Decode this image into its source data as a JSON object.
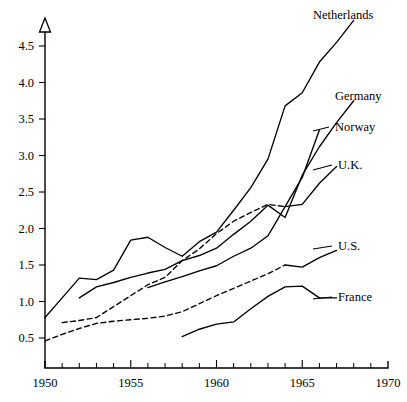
{
  "chart_data": {
    "type": "line",
    "title": "",
    "subtitle": "",
    "xlabel": "",
    "ylabel": "",
    "xlim": [
      1950,
      1970
    ],
    "ylim": [
      0,
      4.9
    ],
    "grid": false,
    "legend_position": "right-end-labels",
    "x_ticks_major": [
      1950,
      1955,
      1960,
      1965,
      1970
    ],
    "x_tick_labels": [
      "1950",
      "1955",
      "1960",
      "1965",
      "1970"
    ],
    "x_ticks_minor": [
      1951,
      1952,
      1953,
      1954,
      1956,
      1957,
      1958,
      1959,
      1961,
      1962,
      1963,
      1964,
      1966,
      1967,
      1968,
      1969
    ],
    "y_ticks": [
      0.5,
      1.0,
      1.5,
      2.0,
      2.5,
      3.0,
      3.5,
      4.0,
      4.5
    ],
    "y_tick_labels": [
      "0.5",
      "1.0",
      "1.5",
      "2.0",
      "2.5",
      "3.0",
      "3.5",
      "4.0",
      "4.5"
    ],
    "y_axis_arrow": true,
    "series": [
      {
        "name": "Netherlands",
        "style": "solid",
        "label": "Netherlands",
        "x": [
          1950,
          1951,
          1952,
          1953,
          1954,
          1955,
          1956,
          1957,
          1958,
          1959,
          1960,
          1961,
          1962,
          1963,
          1964,
          1965,
          1966,
          1967,
          1968
        ],
        "values": [
          0.78,
          1.05,
          1.32,
          1.3,
          1.43,
          1.84,
          1.88,
          1.74,
          1.62,
          1.82,
          1.95,
          2.25,
          2.56,
          2.95,
          3.68,
          3.86,
          4.28,
          4.55,
          4.85
        ]
      },
      {
        "name": "Germany",
        "style": "solid",
        "label": "Germany",
        "x": [
          1952,
          1953,
          1954,
          1955,
          1956,
          1957,
          1958,
          1959,
          1960,
          1961,
          1962,
          1963,
          1964,
          1965,
          1966,
          1967,
          1968
        ],
        "values": [
          1.05,
          1.2,
          1.26,
          1.33,
          1.39,
          1.44,
          1.56,
          1.63,
          1.73,
          1.92,
          2.1,
          2.32,
          2.15,
          2.73,
          3.12,
          3.45,
          3.75
        ]
      },
      {
        "name": "Norway",
        "style": "dashed-then-solid",
        "label": "Norway",
        "solid_from": 1964,
        "x": [
          1951,
          1952,
          1953,
          1954,
          1955,
          1956,
          1957,
          1958,
          1959,
          1960,
          1961,
          1962,
          1963,
          1964,
          1965,
          1966
        ],
        "values": [
          0.71,
          0.74,
          0.78,
          0.93,
          1.08,
          1.23,
          1.33,
          1.56,
          1.72,
          1.93,
          2.1,
          2.22,
          2.33,
          2.3,
          2.7,
          3.35
        ]
      },
      {
        "name": "U.K.",
        "style": "solid",
        "label": "U.K.",
        "x": [
          1956,
          1957,
          1958,
          1959,
          1960,
          1961,
          1962,
          1963,
          1964,
          1965,
          1966,
          1967
        ],
        "values": [
          1.19,
          1.27,
          1.34,
          1.42,
          1.49,
          1.62,
          1.73,
          1.9,
          2.3,
          2.33,
          2.62,
          2.85
        ]
      },
      {
        "name": "U.S.",
        "style": "dashed-then-solid",
        "label": "U.S.",
        "solid_from": 1964,
        "x": [
          1950,
          1951,
          1952,
          1953,
          1954,
          1955,
          1956,
          1957,
          1958,
          1959,
          1960,
          1961,
          1962,
          1963,
          1964,
          1965,
          1966,
          1967
        ],
        "values": [
          0.46,
          0.55,
          0.63,
          0.7,
          0.73,
          0.75,
          0.77,
          0.8,
          0.86,
          0.97,
          1.08,
          1.18,
          1.28,
          1.38,
          1.5,
          1.47,
          1.6,
          1.7
        ]
      },
      {
        "name": "France",
        "style": "solid",
        "label": "France",
        "x": [
          1958,
          1959,
          1960,
          1961,
          1962,
          1963,
          1964,
          1965,
          1966,
          1967
        ],
        "values": [
          0.52,
          0.62,
          0.69,
          0.72,
          0.9,
          1.07,
          1.2,
          1.21,
          1.05,
          1.05
        ]
      }
    ],
    "annotations": []
  },
  "labels": {
    "netherlands": "Netherlands",
    "germany": "Germany",
    "norway": "Norway",
    "uk": "U.K.",
    "us": "U.S.",
    "france": "France"
  },
  "colors": {
    "ink": "#000000",
    "background": "#ffffff"
  }
}
